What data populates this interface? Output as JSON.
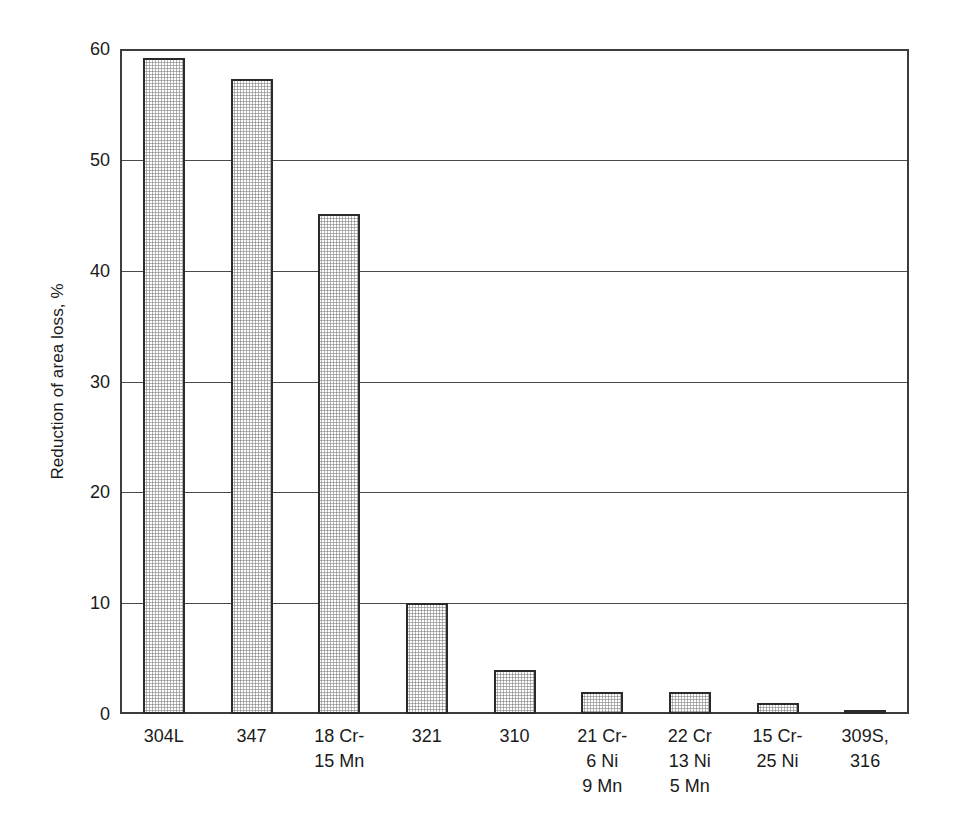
{
  "chart_data": {
    "type": "bar",
    "title": "",
    "subtitle": "",
    "xlabel": "",
    "ylabel": "Reduction of area loss, %",
    "categories": [
      "304L",
      "347",
      "18 Cr-\n15 Mn",
      "321",
      "310",
      "21 Cr-\n6 Ni\n9 Mn",
      "22 Cr\n13 Ni\n5 Mn",
      "15 Cr-\n25 Ni",
      "309S,\n316"
    ],
    "values": [
      59.2,
      57.3,
      45.1,
      10.0,
      4.0,
      2.0,
      2.0,
      1.0,
      0.2
    ],
    "ylim": [
      0,
      60
    ],
    "yticks": [
      0,
      10,
      20,
      30,
      40,
      50,
      60
    ],
    "ytick_labels": [
      "0",
      "10",
      "20",
      "30",
      "40",
      "50",
      "60"
    ],
    "grid": "horizontal",
    "legend": "none",
    "bar_fill": "#ffffff",
    "bar_pattern": "fine-dot-stipple-gray",
    "bar_border_color": "#2b2b2b",
    "axis_color": "#3c3c3c",
    "background": "#ffffff"
  }
}
